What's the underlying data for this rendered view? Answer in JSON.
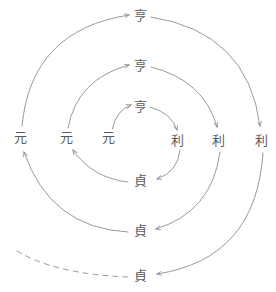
{
  "diagram": {
    "type": "spiral-cycle-diagram",
    "title": "",
    "line_color": "#8d8d8d",
    "text_color": "#5a5a5a",
    "background_color": "#ffffff",
    "stroke_width": 0.9,
    "labels": [
      {
        "id": "heng-outer",
        "text": "亨",
        "x": 140,
        "y": 15,
        "ring": 3,
        "position": "top"
      },
      {
        "id": "heng-middle",
        "text": "亨",
        "x": 140,
        "y": 65,
        "ring": 2,
        "position": "top"
      },
      {
        "id": "heng-inner",
        "text": "亨",
        "x": 140,
        "y": 106,
        "ring": 1,
        "position": "top"
      },
      {
        "id": "yuan-outer",
        "text": "元",
        "x": 20,
        "y": 137,
        "ring": 3,
        "position": "left"
      },
      {
        "id": "yuan-middle",
        "text": "元",
        "x": 66,
        "y": 137,
        "ring": 2,
        "position": "left"
      },
      {
        "id": "yuan-inner",
        "text": "元",
        "x": 108,
        "y": 137,
        "ring": 1,
        "position": "left"
      },
      {
        "id": "li-inner",
        "text": "利",
        "x": 177,
        "y": 140,
        "ring": 1,
        "position": "right"
      },
      {
        "id": "li-middle",
        "text": "利",
        "x": 218,
        "y": 140,
        "ring": 2,
        "position": "right"
      },
      {
        "id": "li-outer",
        "text": "利",
        "x": 261,
        "y": 140,
        "ring": 3,
        "position": "right"
      },
      {
        "id": "zhen-inner",
        "text": "貞",
        "x": 140,
        "y": 180,
        "ring": 1,
        "position": "bottom"
      },
      {
        "id": "zhen-middle",
        "text": "貞",
        "x": 140,
        "y": 230,
        "ring": 2,
        "position": "bottom"
      },
      {
        "id": "zhen-outer",
        "text": "貞",
        "x": 140,
        "y": 275,
        "ring": 3,
        "position": "bottom"
      }
    ],
    "arcs": [
      {
        "id": "arc-inner-yuan-heng",
        "from": "yuan-inner",
        "to": "heng-inner",
        "style": "solid",
        "arrow": true
      },
      {
        "id": "arc-inner-heng-li",
        "from": "heng-inner",
        "to": "li-inner",
        "style": "solid",
        "arrow": true
      },
      {
        "id": "arc-inner-li-zhen",
        "from": "li-inner",
        "to": "zhen-inner",
        "style": "solid",
        "arrow": true
      },
      {
        "id": "arc-inner-zhen-yuan",
        "from": "zhen-inner",
        "to": "yuan-middle",
        "style": "solid",
        "arrow": true
      },
      {
        "id": "arc-mid-yuan-heng",
        "from": "yuan-middle",
        "to": "heng-middle",
        "style": "solid",
        "arrow": true
      },
      {
        "id": "arc-mid-heng-li",
        "from": "heng-middle",
        "to": "li-middle",
        "style": "solid",
        "arrow": true
      },
      {
        "id": "arc-mid-li-zhen",
        "from": "li-middle",
        "to": "zhen-middle",
        "style": "solid",
        "arrow": true
      },
      {
        "id": "arc-mid-zhen-yuan",
        "from": "zhen-middle",
        "to": "yuan-outer",
        "style": "solid",
        "arrow": true
      },
      {
        "id": "arc-outer-yuan-heng",
        "from": "yuan-outer",
        "to": "heng-outer",
        "style": "solid",
        "arrow": true
      },
      {
        "id": "arc-outer-heng-li",
        "from": "heng-outer",
        "to": "li-outer",
        "style": "solid",
        "arrow": true
      },
      {
        "id": "arc-outer-li-zhen",
        "from": "li-outer",
        "to": "zhen-outer",
        "style": "solid",
        "arrow": true
      },
      {
        "id": "arc-outer-zhen-tail",
        "from": "zhen-outer",
        "to": "continuation",
        "style": "dashed",
        "arrow": false
      }
    ]
  }
}
